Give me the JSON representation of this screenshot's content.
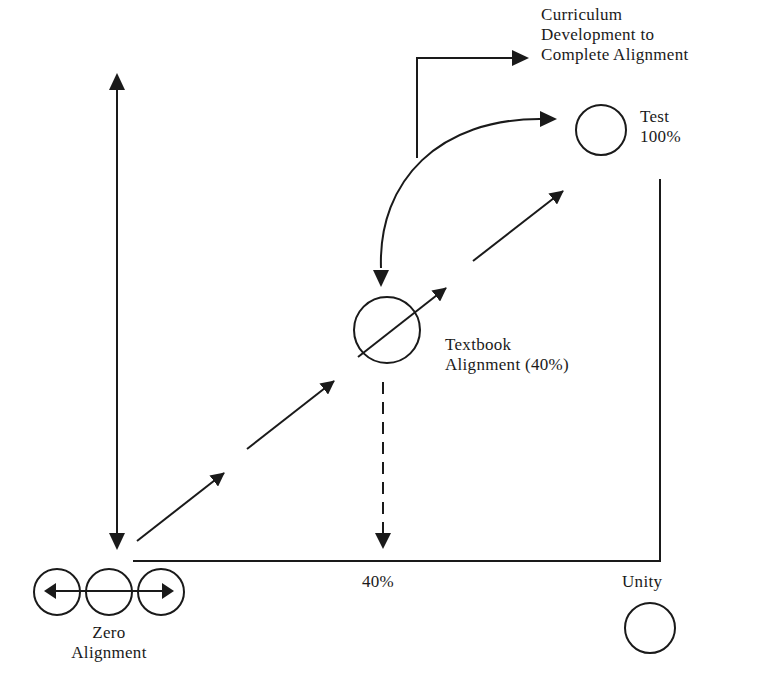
{
  "diagram": {
    "type": "alignment-diagram",
    "labels": {
      "curriculum": [
        "Curriculum",
        "Development to",
        "Complete Alignment"
      ],
      "test": [
        "Test",
        "100%"
      ],
      "textbook": [
        "Textbook",
        "Alignment (40%)"
      ],
      "forty_percent": "40%",
      "unity": "Unity",
      "zero_alignment": [
        "Zero",
        "Alignment"
      ]
    },
    "nodes": [
      {
        "id": "zero-alignment",
        "label": "Zero Alignment",
        "shape": "three overlapping circles with double-headed horizontal arrow"
      },
      {
        "id": "textbook",
        "label": "Textbook Alignment (40%)",
        "shape": "circle crossed by diagonal arrow"
      },
      {
        "id": "test",
        "label": "Test 100%",
        "shape": "circle"
      },
      {
        "id": "unity",
        "label": "Unity",
        "shape": "circle"
      },
      {
        "id": "curriculum",
        "label": "Curriculum Development to Complete Alignment",
        "shape": "text target of elbow arrow"
      }
    ],
    "edges": [
      {
        "from": "zero-alignment",
        "to": "textbook",
        "style": "segmented diagonal arrows"
      },
      {
        "from": "textbook",
        "to": "test",
        "style": "segmented diagonal arrows"
      },
      {
        "from": "test",
        "to": "textbook",
        "style": "curved double-headed arrow"
      },
      {
        "from": "textbook",
        "to": "baseline-40%",
        "style": "dashed downward arrow"
      },
      {
        "from": "midpoint",
        "to": "curriculum",
        "style": "elbow arrow"
      },
      {
        "from": "top-left",
        "to": "zero-alignment",
        "style": "vertical double-headed arrow"
      }
    ],
    "colors": {
      "stroke": "#1a1a1a",
      "background": "#ffffff"
    }
  }
}
